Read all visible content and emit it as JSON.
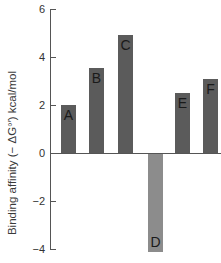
{
  "chart_data": {
    "type": "bar",
    "title": "",
    "xlabel": "",
    "ylabel": "Binding affinity (− ΔG°′) kcal/mol",
    "categories": [
      "A",
      "B",
      "C",
      "D",
      "E",
      "F"
    ],
    "values": [
      2.0,
      3.55,
      4.9,
      -4.1,
      2.5,
      3.1
    ],
    "ylim": [
      -4,
      6
    ],
    "yticks": [
      6,
      4,
      2,
      0,
      -2,
      -4
    ],
    "ytick_labels": [
      "6",
      "4",
      "2",
      "0",
      "−2",
      "−4"
    ],
    "grid": false,
    "legend": null,
    "bar_labels_inside": true,
    "colors": {
      "positive_bar": "#5b5b5b",
      "negative_bar": "#8c8c8c",
      "axis": "#555555"
    }
  },
  "layout": {
    "axis_x": 50,
    "zero_y": 153,
    "px_per_unit": 24,
    "axis_top": 9,
    "axis_bottom": 249,
    "bar_width": 15,
    "bar_lefts": [
      61,
      89,
      118,
      148,
      175,
      203
    ]
  }
}
